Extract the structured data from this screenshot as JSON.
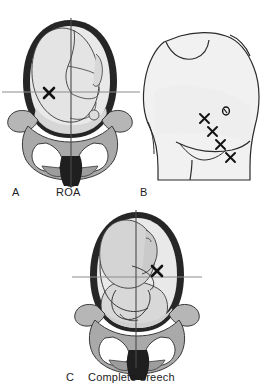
{
  "figure": {
    "type": "medical-illustration",
    "background_color": "#ffffff"
  },
  "palette": {
    "uterine_wall": "#262626",
    "fetus_fill": "#e9e9e9",
    "fetus_shadow": "#cfcfcf",
    "pelvis_bone": "#a9a9a9",
    "pelvis_bone_light": "#d0d0d0",
    "coccyx_dark": "#1f1f1f",
    "outline": "#2b2b2b",
    "crosshair": "#8c8c8c",
    "crosshair_dark": "#303030",
    "skin_fill": "#f1f1f1",
    "skin_shadow": "#dcdcdc",
    "mark_color": "#131313",
    "caption_color": "#1d1d1d"
  },
  "panels": [
    {
      "id": "A",
      "letter": "A",
      "caption": "ROA",
      "caption_full": "Right occiput anterior",
      "view": "anterior view of fetus in utero within maternal pelvis",
      "presentation": "vertex",
      "marks": [
        {
          "name": "fetal-heart-tone-site",
          "symbol": "X",
          "x": 48,
          "y": 92
        }
      ],
      "crosshair": {
        "vertical": {
          "x": 71,
          "y1": 18,
          "y2": 182
        },
        "horizontal": {
          "y": 92,
          "x1": 2,
          "x2": 140
        }
      }
    },
    {
      "id": "B",
      "letter": "B",
      "caption": "",
      "view": "lateral view of maternal abdomen",
      "marks": [
        {
          "name": "fetal-heart-tone-site",
          "symbol": "X",
          "x": 205,
          "y": 118
        },
        {
          "name": "fetal-heart-tone-site",
          "symbol": "X",
          "x": 213,
          "y": 131
        },
        {
          "name": "fetal-heart-tone-site",
          "symbol": "X",
          "x": 221,
          "y": 144
        },
        {
          "name": "fetal-heart-tone-site",
          "symbol": "X",
          "x": 231,
          "y": 157
        },
        {
          "name": "umbilicus",
          "symbol": "o",
          "x": 227,
          "y": 111
        }
      ]
    },
    {
      "id": "C",
      "letter": "C",
      "caption": "Complete breech",
      "view": "anterior view of fetus in utero within maternal pelvis",
      "presentation": "complete breech",
      "marks": [
        {
          "name": "fetal-heart-tone-site",
          "symbol": "X",
          "x": 156,
          "y": 272
        }
      ],
      "crosshair": {
        "vertical": {
          "x": 136,
          "y1": 210,
          "y2": 366
        },
        "horizontal": {
          "y": 277,
          "x1": 72,
          "x2": 202
        }
      }
    }
  ],
  "labels": {
    "panel_a_letter": "A",
    "panel_a_caption": "ROA",
    "panel_b_letter": "B",
    "panel_c_letter": "C",
    "panel_c_caption": "Complete breech"
  }
}
